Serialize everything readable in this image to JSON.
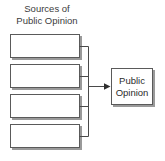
{
  "diagram": {
    "title_line1": "Sources of",
    "title_line2": "Public Opinion",
    "background_color": "#ffffff",
    "line_color": "#4a4a4a",
    "box_border_color": "#5a5a5a",
    "box_fill_color": "#ffffff",
    "box_shadow_color": "#9a9a9a",
    "text_color": "#2b2b2b",
    "source_boxes": [
      {
        "id": "source-box-1",
        "label": "",
        "x": 10,
        "y": 34,
        "w": 70,
        "h": 24
      },
      {
        "id": "source-box-2",
        "label": "",
        "x": 10,
        "y": 64,
        "w": 70,
        "h": 24
      },
      {
        "id": "source-box-3",
        "label": "",
        "x": 10,
        "y": 94,
        "w": 70,
        "h": 24
      },
      {
        "id": "source-box-4",
        "label": "",
        "x": 10,
        "y": 124,
        "w": 70,
        "h": 24
      }
    ],
    "target_box": {
      "id": "public-opinion-box",
      "label_line1": "Public",
      "label_line2": "Opinion",
      "x": 111,
      "y": 68,
      "w": 42,
      "h": 37
    },
    "connector": {
      "bus_x": 88,
      "bus_top": 46,
      "bus_bottom": 136,
      "arrow_y": 86,
      "arrow_from_x": 88,
      "arrow_to_x": 111
    }
  }
}
